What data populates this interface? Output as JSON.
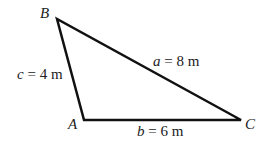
{
  "diagram": {
    "type": "triangle",
    "vertices": {
      "A": {
        "label": "A",
        "x": 84,
        "y": 120
      },
      "B": {
        "label": "B",
        "x": 57,
        "y": 19
      },
      "C": {
        "label": "C",
        "x": 241,
        "y": 120
      }
    },
    "sides": {
      "a": {
        "var": "a",
        "eq": " = 8 m"
      },
      "b": {
        "var": "b",
        "eq": " = 6 m"
      },
      "c": {
        "var": "c",
        "eq": " = 4 m"
      }
    },
    "stroke_color": "#111111"
  }
}
